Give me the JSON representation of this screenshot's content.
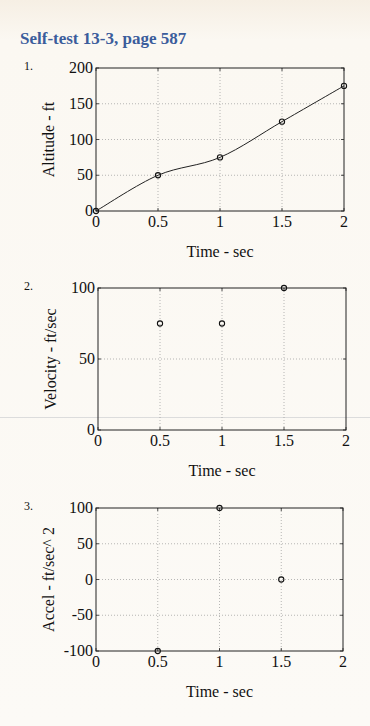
{
  "page": {
    "title": "Self-test 13-3, page 587",
    "title_color": "#3b5d9c"
  },
  "chart_data": [
    {
      "type": "line",
      "number": "1.",
      "title": "",
      "xlabel": "Time - sec",
      "ylabel": "Altitude - ft",
      "xlim": [
        0,
        2
      ],
      "ylim": [
        0,
        200
      ],
      "xticks": [
        0,
        0.5,
        1,
        1.5,
        2
      ],
      "xtick_labels": [
        "0",
        "0.5",
        "1",
        "1.5",
        "2"
      ],
      "yticks": [
        0,
        50,
        100,
        150,
        200
      ],
      "ytick_labels": [
        "0",
        "50",
        "100",
        "150",
        "200"
      ],
      "grid": true,
      "series": [
        {
          "name": "data points",
          "style": "markers",
          "marker": "circle",
          "x": [
            0,
            0.5,
            1,
            1.5,
            2
          ],
          "y": [
            0,
            50,
            75,
            125,
            175
          ]
        },
        {
          "name": "interpolating curve",
          "style": "smooth-line",
          "x": [
            0,
            0.5,
            1,
            1.5,
            2
          ],
          "y": [
            0,
            50,
            75,
            125,
            175
          ]
        }
      ],
      "frame": {
        "left": 96,
        "top": 68,
        "right": 344,
        "bottom": 211
      }
    },
    {
      "type": "scatter",
      "number": "2.",
      "title": "",
      "xlabel": "Time - sec",
      "ylabel": "Velocity - ft/sec",
      "xlim": [
        0,
        2
      ],
      "ylim": [
        0,
        100
      ],
      "xticks": [
        0,
        0.5,
        1,
        1.5,
        2
      ],
      "xtick_labels": [
        "0",
        "0.5",
        "1",
        "1.5",
        "2"
      ],
      "yticks": [
        0,
        50,
        100
      ],
      "ytick_labels": [
        "0",
        "50",
        "100"
      ],
      "grid": true,
      "series": [
        {
          "name": "velocity",
          "style": "markers",
          "marker": "circle",
          "x": [
            0.5,
            1,
            1.5
          ],
          "y": [
            75,
            75,
            100
          ]
        }
      ],
      "frame": {
        "left": 98,
        "top": 288,
        "right": 346,
        "bottom": 430
      }
    },
    {
      "type": "scatter",
      "number": "3.",
      "title": "",
      "xlabel": "Time - sec",
      "ylabel": "Accel - ft/sec^ 2",
      "xlim": [
        0,
        2
      ],
      "ylim": [
        -100,
        100
      ],
      "xticks": [
        0,
        0.5,
        1,
        1.5,
        2
      ],
      "xtick_labels": [
        "0",
        "0.5",
        "1",
        "1.5",
        "2"
      ],
      "yticks": [
        -100,
        -50,
        0,
        50,
        100
      ],
      "ytick_labels": [
        "-100",
        "-50",
        "0",
        "50",
        "100"
      ],
      "grid": true,
      "series": [
        {
          "name": "acceleration",
          "style": "markers",
          "marker": "circle",
          "x": [
            0.5,
            1,
            1.5
          ],
          "y": [
            -100,
            100,
            0
          ]
        }
      ],
      "frame": {
        "left": 96,
        "top": 508,
        "right": 343,
        "bottom": 651
      }
    }
  ]
}
